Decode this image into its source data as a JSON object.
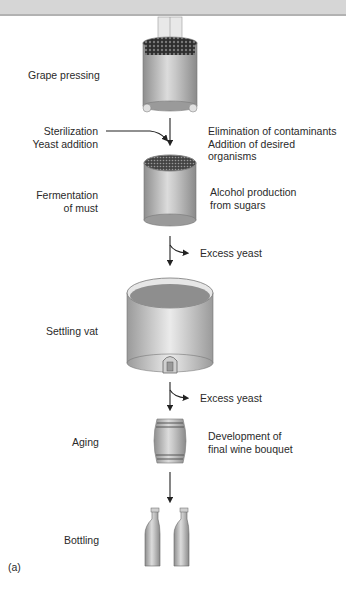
{
  "figure_label": "(a)",
  "steps": [
    {
      "id": "grape-pressing",
      "label": "Grape pressing",
      "note": ""
    },
    {
      "id": "fermentation",
      "label": "Fermentation\nof must",
      "note": "Alcohol production\nfrom sugars"
    },
    {
      "id": "settling-vat",
      "label": "Settling vat",
      "note": ""
    },
    {
      "id": "aging",
      "label": "Aging",
      "note": "Development of\nfinal wine bouquet"
    },
    {
      "id": "bottling",
      "label": "Bottling",
      "note": ""
    }
  ],
  "inputs": {
    "sterilization": "Sterilization\nYeast addition",
    "sterilization_note": "Elimination of contaminants\nAddition of desired organisms"
  },
  "outputs": [
    {
      "label": "Excess yeast"
    },
    {
      "label": "Excess yeast"
    }
  ],
  "colors": {
    "vessel": "#a8a8a8",
    "vessel_highlight": "#e4e4e4",
    "grapes": "#3a3a3a",
    "wine_surface": "#8a8a8a",
    "arrow": "#222222",
    "banner": "#d6d6d6"
  }
}
